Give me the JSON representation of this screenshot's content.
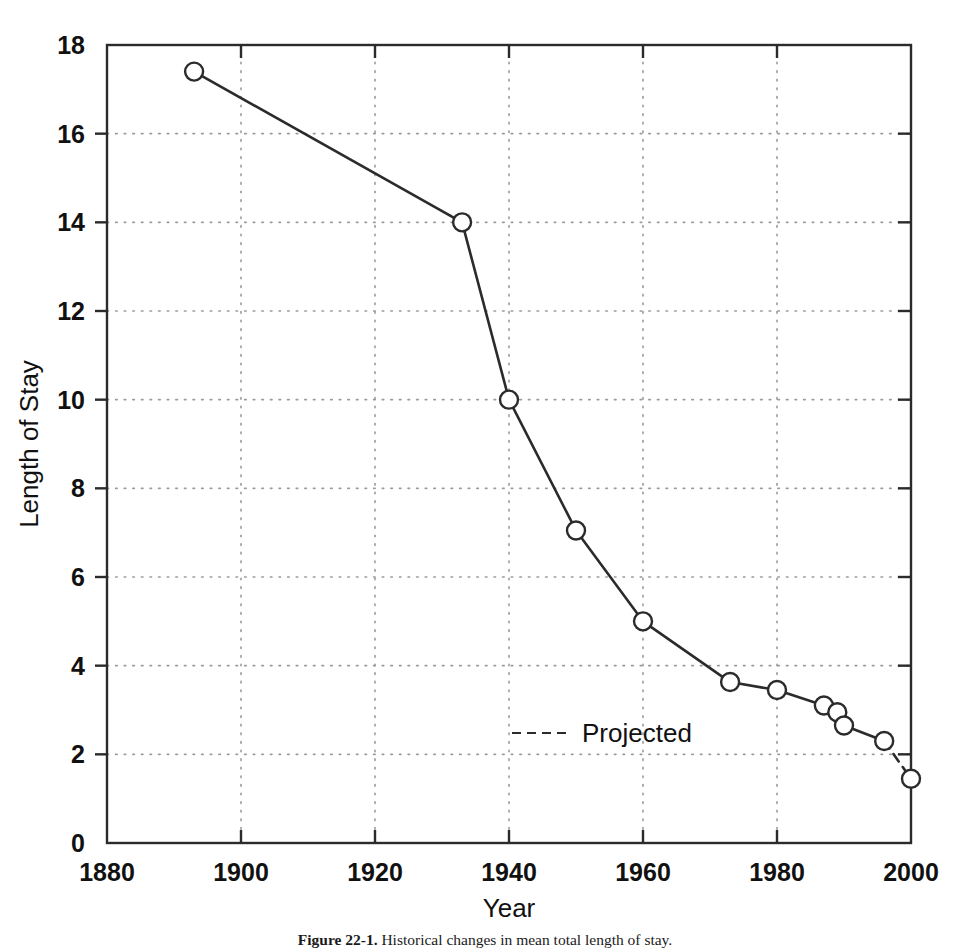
{
  "figure": {
    "caption_label": "Figure 22-1.",
    "caption_text": "Historical changes in mean total length of stay."
  },
  "chart_data": {
    "type": "line",
    "title": "",
    "xlabel": "Year",
    "ylabel": "Length of Stay",
    "xlim": [
      1880,
      2000
    ],
    "ylim": [
      0,
      18
    ],
    "xticks": [
      1880,
      1900,
      1920,
      1940,
      1960,
      1980,
      2000
    ],
    "xtick_labels": [
      "1880",
      "1900",
      "1920",
      "1940",
      "1960",
      "1980",
      "2000"
    ],
    "yticks": [
      0,
      2,
      4,
      6,
      8,
      10,
      12,
      14,
      16,
      18
    ],
    "ytick_labels": [
      "0",
      "2",
      "4",
      "6",
      "8",
      "10",
      "12",
      "14",
      "16",
      "18"
    ],
    "grid": true,
    "grid_style": "dotted",
    "grid_color": "#9a9a9a",
    "line_color": "#2b2b2b",
    "marker": "open-circle",
    "marker_radius": 9,
    "legend": {
      "position": "inside-lower-center",
      "entries": [
        {
          "label": "Projected",
          "style": "dashed"
        }
      ]
    },
    "series": [
      {
        "name": "Observed",
        "style": "solid",
        "x": [
          1893,
          1933,
          1940,
          1950,
          1960,
          1973,
          1980,
          1987,
          1989,
          1990,
          1996
        ],
        "y": [
          17.4,
          14.0,
          10.0,
          7.05,
          5.0,
          3.63,
          3.45,
          3.1,
          2.95,
          2.65,
          2.3
        ]
      },
      {
        "name": "Projected",
        "style": "dashed",
        "x": [
          1996,
          2000
        ],
        "y": [
          2.3,
          1.45
        ]
      }
    ],
    "points": [
      {
        "x": 1893,
        "y": 17.4,
        "projected": false
      },
      {
        "x": 1933,
        "y": 14.0,
        "projected": false
      },
      {
        "x": 1940,
        "y": 10.0,
        "projected": false
      },
      {
        "x": 1950,
        "y": 7.05,
        "projected": false
      },
      {
        "x": 1960,
        "y": 5.0,
        "projected": false
      },
      {
        "x": 1973,
        "y": 3.63,
        "projected": false
      },
      {
        "x": 1980,
        "y": 3.45,
        "projected": false
      },
      {
        "x": 1987,
        "y": 3.1,
        "projected": false
      },
      {
        "x": 1989,
        "y": 2.95,
        "projected": false
      },
      {
        "x": 1990,
        "y": 2.65,
        "projected": false
      },
      {
        "x": 1996,
        "y": 2.3,
        "projected": false
      },
      {
        "x": 2000,
        "y": 1.45,
        "projected": true
      }
    ]
  }
}
